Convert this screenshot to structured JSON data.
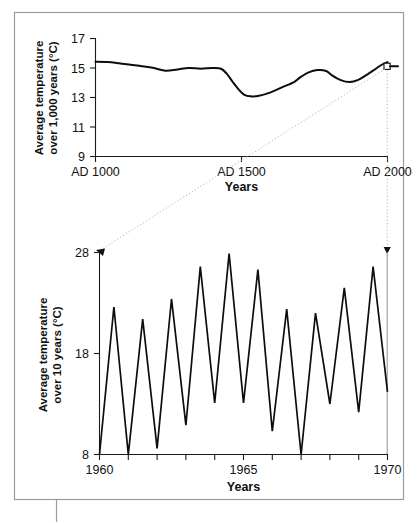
{
  "figure": {
    "caption": "",
    "frame_color": "#9c9c9c",
    "background": "#ffffff",
    "curve_color": "#0d0d0d",
    "connector_color": "#b5b5b5"
  },
  "chart_data": [
    {
      "type": "line",
      "id": "millennial-temperature",
      "title": "",
      "xlabel": "Years",
      "ylabel": "Average temperature\nover 1,000 years (°C)",
      "ylabel_line1": "Average temperature",
      "ylabel_line2": "over 1,000 years (°C)",
      "xlim": [
        1000,
        2000
      ],
      "ylim": [
        9,
        17
      ],
      "yticks": [
        9,
        11,
        13,
        15,
        17
      ],
      "ytick_labels": [
        "9",
        "11",
        "13",
        "15",
        "17"
      ],
      "xticks": [
        1000,
        1500,
        2000
      ],
      "xtick_labels": [
        "AD 1000",
        "AD 1500",
        "AD 2000"
      ],
      "grid": false,
      "legend": "none",
      "marker_point": {
        "x": 2000,
        "y": 15.4,
        "shape": "square"
      },
      "x": [
        1000,
        1040,
        1080,
        1120,
        1160,
        1200,
        1240,
        1280,
        1320,
        1360,
        1400,
        1430,
        1450,
        1470,
        1490,
        1510,
        1530,
        1560,
        1600,
        1640,
        1680,
        1700,
        1730,
        1760,
        1790,
        1810,
        1840,
        1870,
        1900,
        1930,
        1960,
        1980,
        2000
      ],
      "y": [
        15.42,
        15.4,
        15.32,
        15.22,
        15.12,
        15.0,
        14.82,
        14.9,
        15.0,
        14.95,
        15.0,
        14.95,
        14.6,
        14.05,
        13.55,
        13.18,
        13.08,
        13.12,
        13.35,
        13.7,
        14.05,
        14.35,
        14.7,
        14.86,
        14.8,
        14.5,
        14.18,
        14.05,
        14.2,
        14.55,
        14.95,
        15.22,
        15.4
      ]
    },
    {
      "type": "line",
      "id": "decadal-temperature",
      "title": "",
      "xlabel": "Years",
      "ylabel": "Average temperature\nover 10 years (°C)",
      "ylabel_line1": "Average temperature",
      "ylabel_line2": "over 10 years (°C)",
      "xlim": [
        1960,
        1970
      ],
      "ylim": [
        8,
        28
      ],
      "yticks": [
        8,
        18,
        28
      ],
      "ytick_labels": [
        "8",
        "18",
        "28"
      ],
      "xticks": [
        1960,
        1961,
        1962,
        1963,
        1964,
        1965,
        1966,
        1967,
        1968,
        1969,
        1970
      ],
      "xtick_labels_shown": {
        "1960": "1960",
        "1965": "1965",
        "1970": "1970"
      },
      "grid": false,
      "legend": "none",
      "x": [
        1960.0,
        1960.5,
        1961.0,
        1961.5,
        1962.0,
        1962.5,
        1963.0,
        1963.5,
        1964.0,
        1964.5,
        1965.0,
        1965.5,
        1966.0,
        1966.5,
        1967.0,
        1967.5,
        1968.0,
        1968.5,
        1969.0,
        1969.5,
        1970.0
      ],
      "y": [
        8.0,
        22.6,
        8.0,
        21.4,
        8.6,
        23.4,
        10.9,
        26.6,
        13.1,
        27.9,
        13.1,
        26.3,
        10.3,
        22.4,
        8.0,
        22.0,
        13.0,
        24.5,
        12.2,
        26.6,
        14.2
      ]
    }
  ],
  "annotations": {
    "connector_top_label": "",
    "zoom_indicator": "dotted-projection-lines"
  }
}
